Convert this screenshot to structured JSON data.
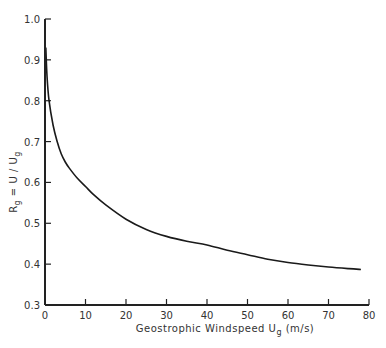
{
  "chart_data": {
    "type": "line",
    "title": "",
    "xlabel": "Geostrophic Windspeed U_g (m/s)",
    "xlabel_parts": {
      "main": "Geostrophic Windspeed U",
      "sub": "g",
      "unit": " (m/s)"
    },
    "ylabel": "R_g = U/U_g",
    "ylabel_parts": {
      "r": "R",
      "r_sub": "g",
      "mid": " = U / U",
      "u_sub": "g"
    },
    "xlim": [
      0,
      80
    ],
    "ylim": [
      0.3,
      1.0
    ],
    "xticks": [
      0,
      10,
      20,
      30,
      40,
      50,
      60,
      70,
      80
    ],
    "yticks": [
      0.3,
      0.4,
      0.5,
      0.6,
      0.7,
      0.8,
      0.9,
      1.0
    ],
    "xtick_labels": [
      "0",
      "10",
      "20",
      "30",
      "40",
      "50",
      "60",
      "70",
      "80"
    ],
    "ytick_labels": [
      "0.3",
      "0.4",
      "0.5",
      "0.6",
      "0.7",
      "0.8",
      "0.9",
      "1.0"
    ],
    "grid": false,
    "legend": null,
    "series": [
      {
        "name": "R_g",
        "x": [
          0.2,
          0.5,
          1,
          2,
          3,
          4,
          5,
          6,
          8,
          10,
          12,
          15,
          20,
          25,
          30,
          35,
          40,
          45,
          50,
          55,
          60,
          65,
          70,
          75,
          78
        ],
        "y": [
          0.93,
          0.86,
          0.8,
          0.74,
          0.7,
          0.67,
          0.65,
          0.635,
          0.61,
          0.59,
          0.57,
          0.545,
          0.51,
          0.485,
          0.468,
          0.456,
          0.447,
          0.434,
          0.423,
          0.412,
          0.404,
          0.398,
          0.393,
          0.389,
          0.387
        ]
      }
    ]
  }
}
